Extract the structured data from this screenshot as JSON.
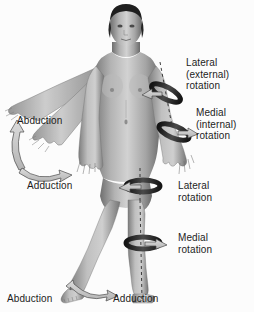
{
  "figure": {
    "background_color": "#fcfcfc",
    "rendering": "grayscale-photographic",
    "text_color": "#1c1c1c",
    "arrow_fill": "#c9c9c9",
    "arrow_stroke": "#5a5a5a",
    "band_dark": "#232323",
    "axis_line": "dashed"
  },
  "labels": {
    "lateral_external_rotation": "Lateral\n(external)\nrotation",
    "medial_internal_rotation": "Medial\n(internal)\nrotation",
    "lateral_rotation": "Lateral\nrotation",
    "medial_rotation": "Medial\nrotation",
    "abduction_arm": "Abduction",
    "adduction_arm": "Adduction",
    "abduction_leg": "Abduction",
    "adduction_leg": "Adduction"
  },
  "movements": [
    {
      "name": "Lateral (external) rotation",
      "region": "shoulder-upper-arm",
      "side": "figure-left"
    },
    {
      "name": "Medial (internal) rotation",
      "region": "forearm",
      "side": "figure-left"
    },
    {
      "name": "Lateral rotation",
      "region": "thigh-knee",
      "side": "figure-left"
    },
    {
      "name": "Medial rotation",
      "region": "lower-leg",
      "side": "figure-left"
    },
    {
      "name": "Abduction",
      "region": "shoulder",
      "side": "figure-right"
    },
    {
      "name": "Adduction",
      "region": "shoulder",
      "side": "figure-right"
    },
    {
      "name": "Abduction",
      "region": "hip",
      "side": "figure-right"
    },
    {
      "name": "Adduction",
      "region": "hip",
      "side": "figure-right"
    }
  ]
}
